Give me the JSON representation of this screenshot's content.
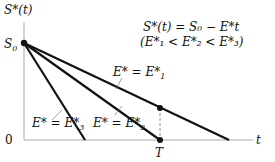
{
  "diagram": {
    "y_axis_label": "S*(t)",
    "x_axis_label": "t",
    "origin_label": "0",
    "s0_label": "S",
    "s0_sub": "0",
    "t_label": "T",
    "formula_line1": "S*(t) = S₀ − E*t",
    "formula_line2": "(E*₁ < E*₂ < E*₃)",
    "lines": [
      {
        "name": "E1",
        "label": "E* = E*",
        "sub": "1"
      },
      {
        "name": "E2",
        "label": "E* = E*",
        "sub": "2"
      },
      {
        "name": "E3",
        "label": "E* = E*",
        "sub": "3"
      }
    ]
  }
}
